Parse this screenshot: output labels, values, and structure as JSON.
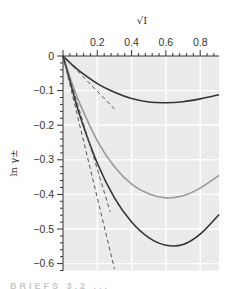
{
  "chart_data": {
    "type": "line",
    "title": "",
    "xlabel": "√I",
    "ylabel": "ln γ±",
    "xlim": [
      0,
      0.91
    ],
    "ylim": [
      -0.62,
      0
    ],
    "x_ticks": [
      0.2,
      0.4,
      0.6,
      0.8
    ],
    "x_tick_labels": [
      "0.2",
      "0.4",
      "0.6",
      "0.8"
    ],
    "y_ticks": [
      0,
      -0.1,
      -0.2,
      -0.3,
      -0.4,
      -0.5,
      -0.6
    ],
    "y_tick_labels": [
      "0",
      "−0.1",
      "−0.2",
      "−0.3",
      "−0.4",
      "−0.5",
      "−0.6"
    ],
    "x_axis_position": "top",
    "grid": true,
    "legend": null,
    "series": [
      {
        "name": "curve-1 (solid, dark)",
        "style": "solid",
        "color": "#333333",
        "x": [
          0,
          0.05,
          0.1,
          0.2,
          0.3,
          0.4,
          0.5,
          0.6,
          0.7,
          0.8,
          0.91
        ],
        "y": [
          0,
          -0.024,
          -0.045,
          -0.08,
          -0.105,
          -0.123,
          -0.133,
          -0.135,
          -0.132,
          -0.124,
          -0.112
        ]
      },
      {
        "name": "curve-2 (solid, gray)",
        "style": "solid",
        "color": "#9a9a9a",
        "x": [
          0,
          0.05,
          0.1,
          0.2,
          0.3,
          0.4,
          0.5,
          0.6,
          0.7,
          0.8,
          0.91
        ],
        "y": [
          0,
          -0.075,
          -0.14,
          -0.245,
          -0.32,
          -0.37,
          -0.398,
          -0.41,
          -0.404,
          -0.382,
          -0.345
        ]
      },
      {
        "name": "curve-3 (solid, dark)",
        "style": "solid",
        "color": "#333333",
        "x": [
          0,
          0.05,
          0.1,
          0.2,
          0.3,
          0.4,
          0.5,
          0.6,
          0.7,
          0.8,
          0.91
        ],
        "y": [
          0,
          -0.09,
          -0.175,
          -0.31,
          -0.41,
          -0.48,
          -0.525,
          -0.547,
          -0.545,
          -0.515,
          -0.458
        ]
      },
      {
        "name": "limiting-law-1 (dashed)",
        "style": "dashed",
        "color": "#555555",
        "x": [
          0,
          0.3
        ],
        "y": [
          0,
          -0.153
        ]
      },
      {
        "name": "limiting-law-2 (dashed)",
        "style": "dashed",
        "color": "#555555",
        "x": [
          0,
          0.275
        ],
        "y": [
          0,
          -0.45
        ]
      },
      {
        "name": "limiting-law-3 (dashed)",
        "style": "dashed",
        "color": "#555555",
        "x": [
          0,
          0.3
        ],
        "y": [
          0,
          -0.615
        ]
      }
    ],
    "colors": {
      "plot_background": "#ebebeb",
      "grid": "#ffffff",
      "axis": "#333333"
    }
  },
  "caption_fragment": "BRIEFS 3.2 ..."
}
